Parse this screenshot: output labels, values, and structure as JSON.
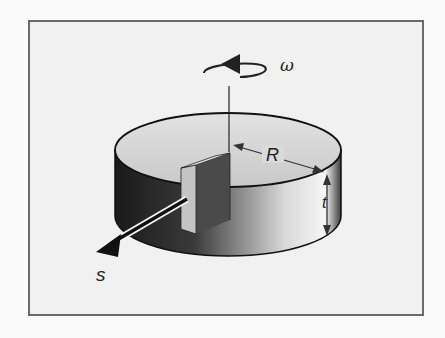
{
  "figure": {
    "labels": {
      "omega": "ω",
      "radius": "R",
      "thickness": "t",
      "direction": "s"
    },
    "colors": {
      "background": "#f1f1f1",
      "frame": "#6a6a6a",
      "disk_top": "#d4d4d4",
      "disk_side_dark": "#1e1e1e",
      "disk_side_light": "#f4f4f4",
      "outline": "#111111"
    }
  }
}
